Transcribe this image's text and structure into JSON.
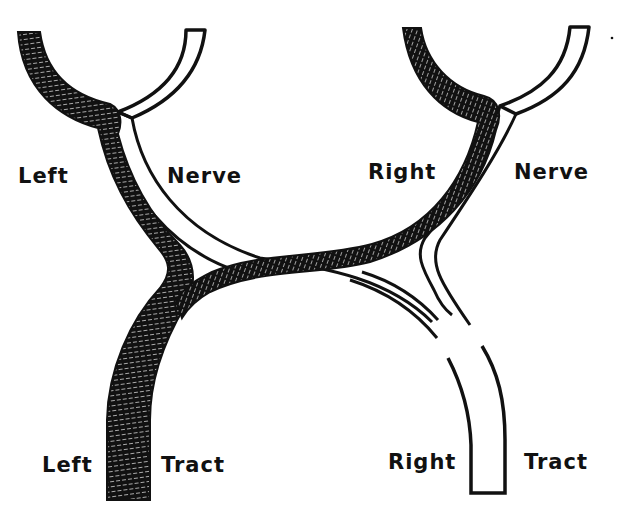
{
  "diagram": {
    "type": "optic chiasm schematic",
    "colors": {
      "crossed_fibers": "#111111",
      "uncrossed_fibers": "#ffffff",
      "outline": "#111111",
      "background": "#ffffff",
      "hatch": "#f4f4f4"
    },
    "labels": {
      "left_nerve_1": "Left",
      "left_nerve_2": "Nerve",
      "right_nerve_1": "Right",
      "right_nerve_2": "Nerve",
      "left_tract_1": "Left",
      "left_tract_2": "Tract",
      "right_tract_1": "Right",
      "right_tract_2": "Tract"
    },
    "structures": [
      {
        "name": "left-nerve-crossing-band",
        "fill": "black",
        "from": "left nerve",
        "to": "left tract"
      },
      {
        "name": "left-nerve-uncrossed-band",
        "fill": "white",
        "from": "left nerve",
        "to": "right tract"
      },
      {
        "name": "right-nerve-crossing-band",
        "fill": "black",
        "from": "right nerve",
        "to": "left tract"
      },
      {
        "name": "right-nerve-uncrossed-band",
        "fill": "white",
        "from": "right nerve",
        "to": "right tract"
      }
    ]
  }
}
